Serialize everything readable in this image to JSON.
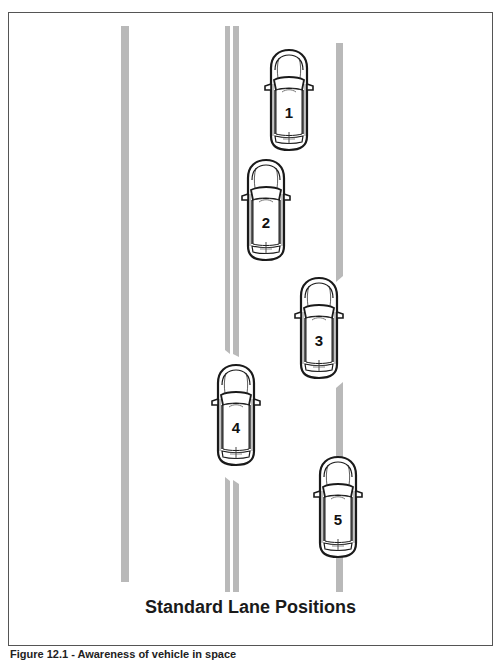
{
  "figure": {
    "title": "Standard Lane Positions",
    "caption": "Figure 12.1 - Awareness of vehicle in space"
  },
  "colors": {
    "lane_line": "#b9b9b9",
    "frame_border": "#555555",
    "car_outline": "#1a1a1a",
    "background": "#ffffff"
  },
  "lane_lines": [
    {
      "name": "left-edge-line",
      "x": 121,
      "width": 8,
      "segments": [
        [
          26,
          582
        ]
      ]
    },
    {
      "name": "center-double-line-a",
      "x": 225,
      "width": 5,
      "segments": [
        [
          26,
          352
        ],
        [
          477,
          592
        ]
      ]
    },
    {
      "name": "center-double-line-b",
      "x": 233,
      "width": 6,
      "segments": [
        [
          26,
          354
        ],
        [
          480,
          592
        ]
      ]
    },
    {
      "name": "right-lane-line",
      "x": 336,
      "width": 7,
      "segments": [
        [
          43,
          280
        ],
        [
          384,
          592
        ]
      ]
    }
  ],
  "vehicles": [
    {
      "label": "1",
      "x": 263,
      "y": 50
    },
    {
      "label": "2",
      "x": 240,
      "y": 160
    },
    {
      "label": "3",
      "x": 293,
      "y": 278
    },
    {
      "label": "4",
      "x": 210,
      "y": 365
    },
    {
      "label": "5",
      "x": 312,
      "y": 457
    }
  ]
}
